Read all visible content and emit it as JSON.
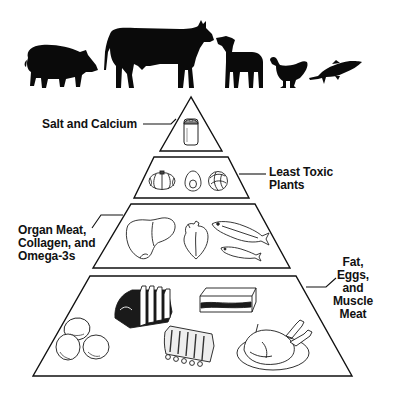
{
  "diagram": {
    "type": "food-pyramid",
    "animals": [
      {
        "name": "pig",
        "icon": "pig-silhouette-icon"
      },
      {
        "name": "cow",
        "icon": "cow-silhouette-icon"
      },
      {
        "name": "lamb",
        "icon": "lamb-silhouette-icon"
      },
      {
        "name": "chicken",
        "icon": "chicken-silhouette-icon"
      },
      {
        "name": "fish",
        "icon": "fish-silhouette-icon"
      }
    ],
    "tiers": [
      {
        "level": 1,
        "label_lines": [
          "Salt and Calcium"
        ],
        "items": [
          "salt shaker"
        ]
      },
      {
        "level": 2,
        "label_lines": [
          "Least Toxic",
          "Plants"
        ],
        "items": [
          "squash",
          "avocado",
          "cabbage"
        ]
      },
      {
        "level": 3,
        "label_lines": [
          "Organ Meat,",
          "Collagen, and",
          "Omega-3s"
        ],
        "items": [
          "liver",
          "heart",
          "sardine",
          "sardine"
        ]
      },
      {
        "level": 4,
        "label_lines": [
          "Fat,",
          "Eggs,",
          "and",
          "Muscle",
          "Meat"
        ],
        "items": [
          "eggs",
          "rack of lamb",
          "fat slab",
          "pork ribs",
          "roast chicken"
        ]
      }
    ]
  },
  "colors": {
    "ink": "#111111",
    "background": "#ffffff"
  }
}
